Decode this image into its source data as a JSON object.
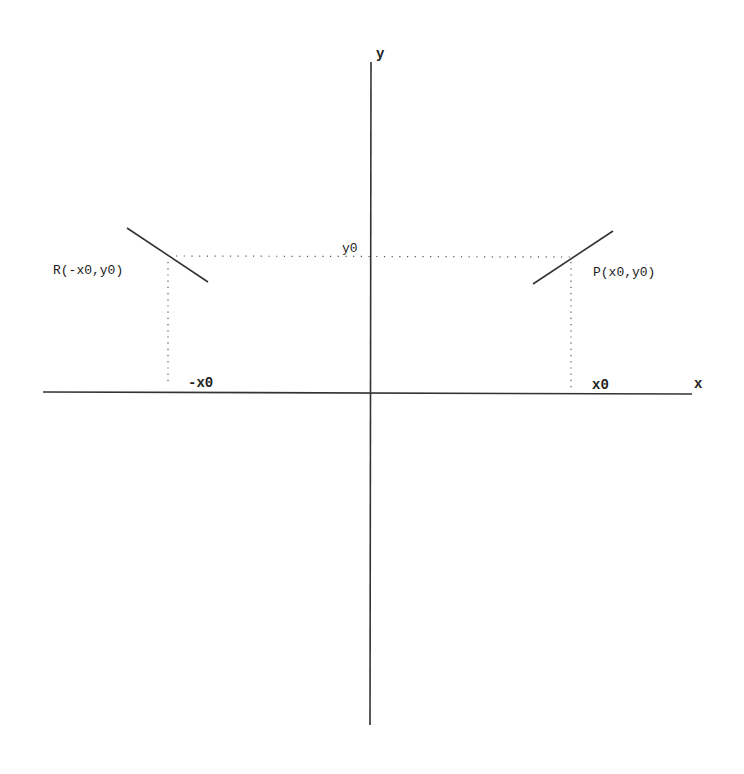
{
  "diagram": {
    "axes": {
      "x_label": "x",
      "y_label": "y"
    },
    "points": [
      {
        "name": "P",
        "label": "P(x0,y0)",
        "x_tick": "x0"
      },
      {
        "name": "R",
        "label": "R(-x0,y0)",
        "x_tick": "-x0"
      }
    ],
    "y_tick": "y0"
  }
}
